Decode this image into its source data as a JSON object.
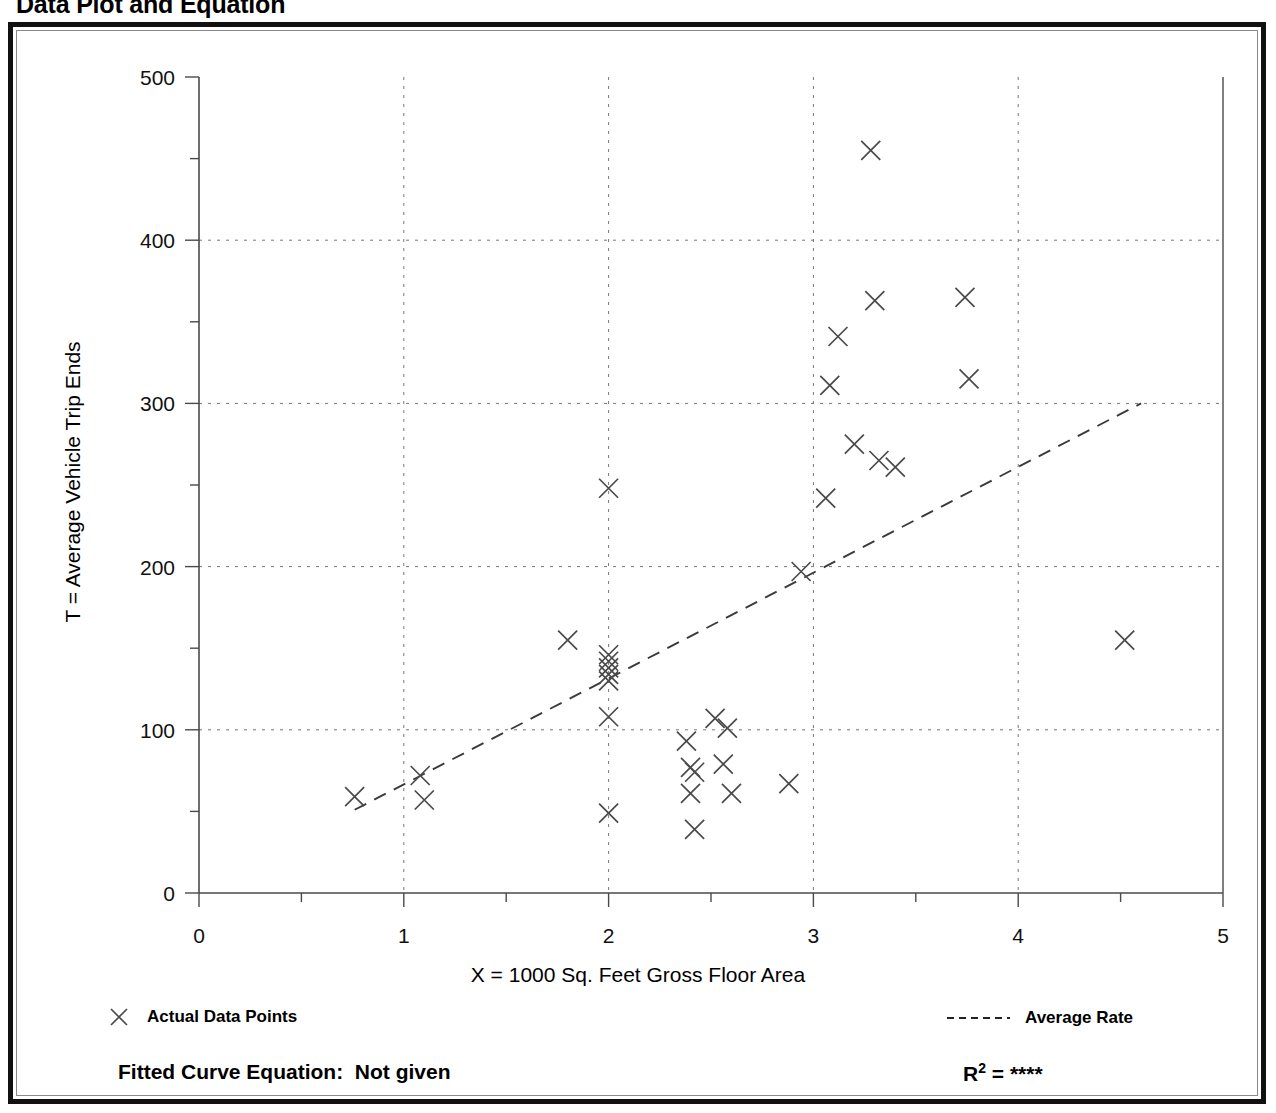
{
  "title": "Data Plot and Equation",
  "axes": {
    "y_label": "T = Average Vehicle Trip Ends",
    "x_label": "X = 1000 Sq. Feet Gross Floor Area",
    "y_ticks": [
      "0",
      "100",
      "200",
      "300",
      "400",
      "500"
    ],
    "x_ticks": [
      "0",
      "1",
      "2",
      "3",
      "4",
      "5"
    ]
  },
  "legend": {
    "data_points_label": "Actual Data Points",
    "average_rate_label": "Average Rate",
    "data_points_marker": "x-marker-icon",
    "average_rate_marker": "dashed-line-icon"
  },
  "footer": {
    "equation_label": "Fitted Curve Equation:",
    "equation_value": "Not given",
    "r2_label": "R",
    "r2_exponent": "2",
    "r2_equals": "=",
    "r2_value": "****"
  },
  "chart_data": {
    "type": "scatter",
    "title": "Data Plot and Equation",
    "xlabel": "X = 1000 Sq. Feet Gross Floor Area",
    "ylabel": "T = Average Vehicle Trip Ends",
    "xlim": [
      0,
      5
    ],
    "ylim": [
      0,
      500
    ],
    "x_major_ticks": [
      0,
      1,
      2,
      3,
      4,
      5
    ],
    "x_minor_ticks": [
      0.5,
      1.5,
      2.5,
      3.5,
      4.5
    ],
    "y_major_ticks": [
      0,
      100,
      200,
      300,
      400,
      500
    ],
    "y_minor_ticks": [
      50,
      150,
      250,
      350,
      450
    ],
    "grid": true,
    "grid_style": "dotted",
    "grid_x_values": [
      1,
      2,
      3,
      4
    ],
    "grid_y_values": [
      100,
      200,
      300,
      400
    ],
    "legend_position": "below-plot",
    "series": [
      {
        "name": "Actual Data Points",
        "type": "scatter",
        "marker": "x",
        "points": [
          [
            0.76,
            59
          ],
          [
            1.08,
            72
          ],
          [
            1.1,
            57
          ],
          [
            1.8,
            155
          ],
          [
            2.0,
            248
          ],
          [
            2.0,
            146
          ],
          [
            2.0,
            142
          ],
          [
            2.0,
            138
          ],
          [
            2.0,
            134
          ],
          [
            2.0,
            130
          ],
          [
            2.0,
            108
          ],
          [
            2.0,
            49
          ],
          [
            2.38,
            93
          ],
          [
            2.4,
            77
          ],
          [
            2.42,
            74
          ],
          [
            2.4,
            61
          ],
          [
            2.42,
            39
          ],
          [
            2.52,
            107
          ],
          [
            2.56,
            79
          ],
          [
            2.58,
            101
          ],
          [
            2.6,
            61
          ],
          [
            2.88,
            67
          ],
          [
            2.94,
            197
          ],
          [
            3.06,
            242
          ],
          [
            3.08,
            311
          ],
          [
            3.12,
            341
          ],
          [
            3.2,
            275
          ],
          [
            3.28,
            455
          ],
          [
            3.3,
            363
          ],
          [
            3.32,
            265
          ],
          [
            3.4,
            261
          ],
          [
            3.74,
            365
          ],
          [
            3.76,
            315
          ],
          [
            4.52,
            155
          ]
        ]
      },
      {
        "name": "Average Rate",
        "type": "line",
        "style": "dashed",
        "points": [
          [
            0.76,
            51
          ],
          [
            4.6,
            300
          ]
        ]
      }
    ]
  }
}
